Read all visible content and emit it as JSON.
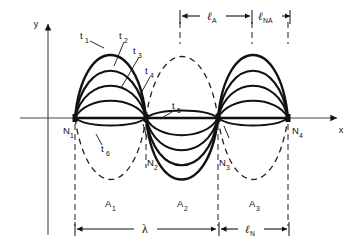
{
  "figure": {
    "kind": "standing-wave-diagram",
    "background_color": "#ffffff",
    "ink_color": "#111111",
    "axes": {
      "y_label": "y",
      "x_label": "x",
      "y_axis_x": 48,
      "x_axis_y": 118,
      "y_axis_top": 20,
      "y_axis_bottom": 235,
      "x_axis_left": 20,
      "x_axis_right": 341
    },
    "node_labels": [
      {
        "text": "N",
        "sub": "1",
        "x": 68,
        "y": 133
      },
      {
        "text": "N",
        "sub": "2",
        "x": 150,
        "y": 165
      },
      {
        "text": "N",
        "sub": "3",
        "x": 221,
        "y": 165
      },
      {
        "text": "N",
        "sub": "4",
        "x": 292,
        "y": 133
      }
    ],
    "antinode_labels": [
      {
        "text": "A",
        "sub": "1",
        "x": 108,
        "y": 206
      },
      {
        "text": "A",
        "sub": "2",
        "x": 180,
        "y": 206
      },
      {
        "text": "A",
        "sub": "3",
        "x": 252,
        "y": 206
      }
    ],
    "time_labels": [
      {
        "text": "t",
        "sub": "1",
        "x": 84,
        "y": 37
      },
      {
        "text": "t",
        "sub": "2",
        "x": 120,
        "y": 37
      },
      {
        "text": "t",
        "sub": "3",
        "x": 136,
        "y": 52
      },
      {
        "text": "t",
        "sub": "4",
        "x": 148,
        "y": 72
      },
      {
        "text": "t",
        "sub": "5",
        "x": 172,
        "y": 108
      },
      {
        "text": "t",
        "sub": "6",
        "x": 100,
        "y": 150
      }
    ],
    "dimensions": [
      {
        "name": "lambda",
        "text": "λ",
        "sub": "",
        "x1": 75,
        "x2": 218,
        "y": 229,
        "label_x": 145,
        "label_y": 227,
        "italic": false
      },
      {
        "name": "ell-N",
        "text": "ℓ",
        "sub": "N",
        "x1": 219,
        "x2": 289,
        "y": 229,
        "label_x": 248,
        "label_y": 227,
        "italic": true
      },
      {
        "name": "ell-A",
        "text": "ℓ",
        "sub": "A",
        "x1": 180,
        "x2": 252,
        "y": 16,
        "label_x": 210,
        "label_y": 14,
        "italic": true
      },
      {
        "name": "ell-NA",
        "text": "ℓ",
        "sub": "NA",
        "x1": 254,
        "x2": 290,
        "y": 16,
        "label_x": 262,
        "label_y": 14,
        "italic": true
      }
    ],
    "nodes_x": [
      75,
      146,
      218,
      288
    ],
    "description_terms": {
      "wavelength_symbol": "λ",
      "length_symbol": "ℓ"
    }
  }
}
